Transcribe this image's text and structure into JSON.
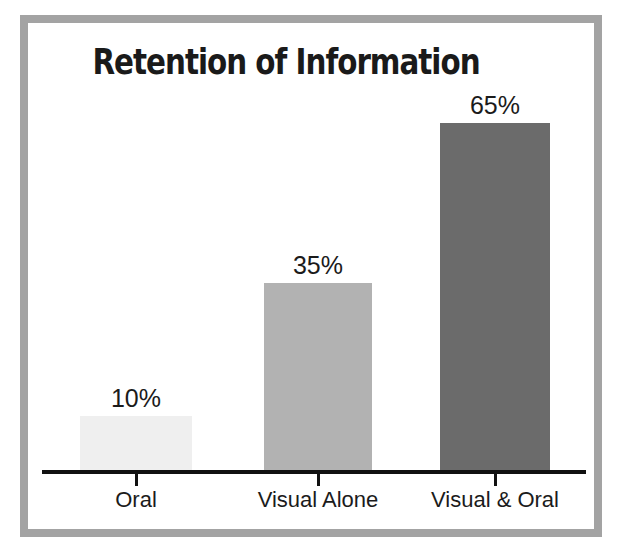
{
  "frame": {
    "border_color": "#a3a3a3",
    "background": "#ffffff"
  },
  "chart_data": {
    "type": "bar",
    "title": "Retention of Information",
    "xlabel": "",
    "ylabel": "",
    "categories": [
      "Oral",
      "Visual Alone",
      "Visual & Oral"
    ],
    "values": [
      10,
      35,
      65
    ],
    "value_labels": [
      "10%",
      "35%",
      "65%"
    ],
    "ylim": [
      0,
      75
    ],
    "grid": false,
    "legend": "none",
    "axis_line": true,
    "tick_marks": true,
    "bar_colors": [
      "#efefef",
      "#b2b2b2",
      "#6b6b6b"
    ],
    "series": [
      {
        "name": "Retention",
        "values": [
          10,
          35,
          65
        ]
      }
    ],
    "points": [
      {
        "category": "Oral",
        "value": 10,
        "label": "10%",
        "color": "#efefef"
      },
      {
        "category": "Visual Alone",
        "value": 35,
        "label": "35%",
        "color": "#b2b2b2"
      },
      {
        "category": "Visual & Oral",
        "value": 65,
        "label": "65%",
        "color": "#6b6b6b"
      }
    ]
  }
}
